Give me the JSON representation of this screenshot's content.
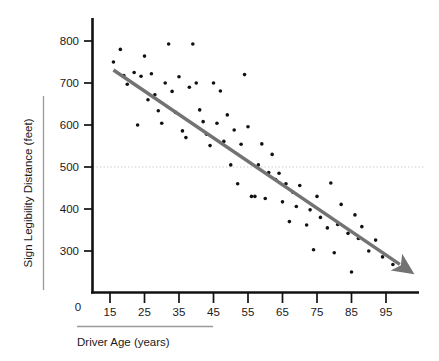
{
  "chart_data": {
    "type": "scatter",
    "title": "",
    "xlabel": "Driver Age (years)",
    "ylabel": "Sign Legibility Distance (feet)",
    "xlim": [
      5,
      101
    ],
    "ylim": [
      240,
      820
    ],
    "xticks": [
      15,
      25,
      35,
      45,
      55,
      65,
      75,
      85,
      95
    ],
    "xtick_labels": [
      "15",
      "25",
      "35",
      "45",
      "55",
      "65",
      "75",
      "85",
      "95"
    ],
    "yticks": [
      300,
      400,
      500,
      600,
      700,
      800
    ],
    "ytick_labels": [
      "300",
      "400",
      "500",
      "600",
      "700",
      "800"
    ],
    "origin_label": "0",
    "grid": false,
    "legend": null,
    "reference_line": {
      "name": "y-500-dotted-reference",
      "orientation": "horizontal",
      "value": 500,
      "style": "dotted",
      "color": "#c8c8c8"
    },
    "trend_line": {
      "name": "regression-trend-arrow",
      "type": "linear-fit-with-arrowhead",
      "color": "#737373",
      "x_start": 16,
      "y_start": 731,
      "x_end": 99,
      "y_end": 268
    },
    "marker": {
      "shape": "circle",
      "color": "#111111",
      "size_px": 3.6
    },
    "points": [
      {
        "x": 16,
        "y": 750
      },
      {
        "x": 18,
        "y": 780
      },
      {
        "x": 19,
        "y": 718
      },
      {
        "x": 20,
        "y": 697
      },
      {
        "x": 22,
        "y": 725
      },
      {
        "x": 23,
        "y": 600
      },
      {
        "x": 24,
        "y": 716
      },
      {
        "x": 25,
        "y": 764
      },
      {
        "x": 26,
        "y": 660
      },
      {
        "x": 27,
        "y": 722
      },
      {
        "x": 28,
        "y": 672
      },
      {
        "x": 29,
        "y": 634
      },
      {
        "x": 30,
        "y": 604
      },
      {
        "x": 31,
        "y": 700
      },
      {
        "x": 32,
        "y": 793
      },
      {
        "x": 33,
        "y": 680
      },
      {
        "x": 34,
        "y": 630
      },
      {
        "x": 35,
        "y": 715
      },
      {
        "x": 36,
        "y": 586
      },
      {
        "x": 37,
        "y": 570
      },
      {
        "x": 38,
        "y": 690
      },
      {
        "x": 39,
        "y": 793
      },
      {
        "x": 40,
        "y": 700
      },
      {
        "x": 41,
        "y": 636
      },
      {
        "x": 42,
        "y": 608
      },
      {
        "x": 43,
        "y": 578
      },
      {
        "x": 44,
        "y": 551
      },
      {
        "x": 45,
        "y": 700
      },
      {
        "x": 46,
        "y": 604
      },
      {
        "x": 47,
        "y": 681
      },
      {
        "x": 48,
        "y": 561
      },
      {
        "x": 49,
        "y": 624
      },
      {
        "x": 50,
        "y": 505
      },
      {
        "x": 51,
        "y": 588
      },
      {
        "x": 52,
        "y": 460
      },
      {
        "x": 53,
        "y": 554
      },
      {
        "x": 54,
        "y": 720
      },
      {
        "x": 55,
        "y": 596
      },
      {
        "x": 56,
        "y": 430
      },
      {
        "x": 57,
        "y": 430
      },
      {
        "x": 58,
        "y": 505
      },
      {
        "x": 59,
        "y": 555
      },
      {
        "x": 60,
        "y": 425
      },
      {
        "x": 61,
        "y": 487
      },
      {
        "x": 62,
        "y": 530
      },
      {
        "x": 63,
        "y": 470
      },
      {
        "x": 64,
        "y": 485
      },
      {
        "x": 65,
        "y": 417
      },
      {
        "x": 66,
        "y": 460
      },
      {
        "x": 67,
        "y": 370
      },
      {
        "x": 68,
        "y": 440
      },
      {
        "x": 69,
        "y": 406
      },
      {
        "x": 70,
        "y": 456
      },
      {
        "x": 72,
        "y": 362
      },
      {
        "x": 73,
        "y": 398
      },
      {
        "x": 74,
        "y": 303
      },
      {
        "x": 75,
        "y": 430
      },
      {
        "x": 76,
        "y": 380
      },
      {
        "x": 78,
        "y": 355
      },
      {
        "x": 79,
        "y": 462
      },
      {
        "x": 80,
        "y": 296
      },
      {
        "x": 81,
        "y": 363
      },
      {
        "x": 82,
        "y": 411
      },
      {
        "x": 84,
        "y": 342
      },
      {
        "x": 85,
        "y": 250
      },
      {
        "x": 86,
        "y": 386
      },
      {
        "x": 87,
        "y": 330
      },
      {
        "x": 88,
        "y": 358
      },
      {
        "x": 90,
        "y": 300
      },
      {
        "x": 92,
        "y": 326
      },
      {
        "x": 94,
        "y": 286
      },
      {
        "x": 97,
        "y": 268
      }
    ]
  },
  "axis_style": {
    "axis_color": "#111111",
    "label_bracket_color": "#9a9a9a"
  }
}
